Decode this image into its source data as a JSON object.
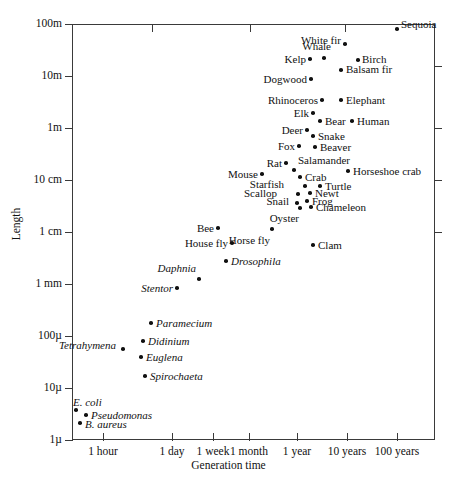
{
  "chart_data": {
    "type": "scatter",
    "title": "",
    "xlabel": "Generation time",
    "ylabel": "Length",
    "xscale": "log",
    "yscale": "log",
    "grid": false,
    "legend": null,
    "xtick_labels": [
      "1 hour",
      "1 day",
      "1 week",
      "1 month",
      "1 year",
      "10 years",
      "100 years"
    ],
    "ytick_labels": [
      "100m",
      "10m",
      "1m",
      "10 cm",
      "1 cm",
      "1 mm",
      "100µ",
      "10µ",
      "1µ"
    ],
    "points": [
      {
        "name": "Sequoia",
        "x": 397,
        "y": 29,
        "lx": 401,
        "ly": 24,
        "side": "l",
        "italic": false
      },
      {
        "name": "White fir",
        "x": 345,
        "y": 44,
        "lx": 341,
        "ly": 40,
        "side": "r",
        "italic": false
      },
      {
        "name": "Birch",
        "x": 358,
        "y": 60,
        "lx": 362,
        "ly": 59,
        "side": "l",
        "italic": false
      },
      {
        "name": "Whale",
        "x": 324,
        "y": 58,
        "lx": 331,
        "ly": 46,
        "side": "r",
        "italic": false
      },
      {
        "name": "Balsam fir",
        "x": 341,
        "y": 70,
        "lx": 346,
        "ly": 69,
        "side": "l",
        "italic": false
      },
      {
        "name": "Kelp",
        "x": 310,
        "y": 59,
        "lx": 306,
        "ly": 59,
        "side": "r",
        "italic": false
      },
      {
        "name": "Dogwood",
        "x": 311,
        "y": 79,
        "lx": 307,
        "ly": 79,
        "side": "r",
        "italic": false
      },
      {
        "name": "Rhinoceros",
        "x": 322,
        "y": 100,
        "lx": 318,
        "ly": 100,
        "side": "r",
        "italic": false
      },
      {
        "name": "Elephant",
        "x": 341,
        "y": 100,
        "lx": 346,
        "ly": 100,
        "side": "l",
        "italic": false
      },
      {
        "name": "Elk",
        "x": 313,
        "y": 113,
        "lx": 309,
        "ly": 113,
        "side": "r",
        "italic": false
      },
      {
        "name": "Bear",
        "x": 320,
        "y": 121,
        "lx": 325,
        "ly": 121,
        "side": "l",
        "italic": false
      },
      {
        "name": "Human",
        "x": 352,
        "y": 121,
        "lx": 357,
        "ly": 121,
        "side": "l",
        "italic": false
      },
      {
        "name": "Deer",
        "x": 307,
        "y": 130,
        "lx": 303,
        "ly": 130,
        "side": "r",
        "italic": false
      },
      {
        "name": "Snake",
        "x": 313,
        "y": 136,
        "lx": 318,
        "ly": 136,
        "side": "l",
        "italic": false
      },
      {
        "name": "Beaver",
        "x": 315,
        "y": 147,
        "lx": 320,
        "ly": 147,
        "side": "l",
        "italic": false
      },
      {
        "name": "Fox",
        "x": 299,
        "y": 146,
        "lx": 295,
        "ly": 146,
        "side": "r",
        "italic": false
      },
      {
        "name": "Rat",
        "x": 286,
        "y": 163,
        "lx": 282,
        "ly": 163,
        "side": "r",
        "italic": false
      },
      {
        "name": "Salamander",
        "x": 294,
        "y": 170,
        "lx": 298,
        "ly": 160,
        "side": "l",
        "italic": false
      },
      {
        "name": "Horseshoe crab",
        "x": 348,
        "y": 171,
        "lx": 353,
        "ly": 171,
        "side": "l",
        "italic": false
      },
      {
        "name": "Mouse",
        "x": 262,
        "y": 174,
        "lx": 258,
        "ly": 174,
        "side": "r",
        "italic": false
      },
      {
        "name": "Crab",
        "x": 300,
        "y": 177,
        "lx": 305,
        "ly": 177,
        "side": "l",
        "italic": false
      },
      {
        "name": "Starfish",
        "x": 305,
        "y": 186,
        "lx": 284,
        "ly": 184,
        "side": "r",
        "italic": false
      },
      {
        "name": "Turtle",
        "x": 320,
        "y": 186,
        "lx": 325,
        "ly": 186,
        "side": "l",
        "italic": false
      },
      {
        "name": "Newt",
        "x": 310,
        "y": 193,
        "lx": 315,
        "ly": 193,
        "side": "l",
        "italic": false
      },
      {
        "name": "Scallop",
        "x": 298,
        "y": 194,
        "lx": 277,
        "ly": 193,
        "side": "r",
        "italic": false
      },
      {
        "name": "Frog",
        "x": 307,
        "y": 201,
        "lx": 312,
        "ly": 201,
        "side": "l",
        "italic": false
      },
      {
        "name": "Chameleon",
        "x": 311,
        "y": 207,
        "lx": 316,
        "ly": 207,
        "side": "l",
        "italic": false
      },
      {
        "name": "Snail",
        "x": 297,
        "y": 203,
        "lx": 289,
        "ly": 201,
        "side": "r",
        "italic": false
      },
      {
        "name": "Oyster",
        "x": 300,
        "y": 208,
        "lx": 299,
        "ly": 218,
        "side": "r",
        "italic": false
      },
      {
        "name": "Horse fly",
        "x": 272,
        "y": 229,
        "lx": 270,
        "ly": 240,
        "side": "r",
        "italic": false
      },
      {
        "name": "Bee",
        "x": 218,
        "y": 228,
        "lx": 214,
        "ly": 228,
        "side": "r",
        "italic": false
      },
      {
        "name": "Clam",
        "x": 313,
        "y": 245,
        "lx": 318,
        "ly": 245,
        "side": "l",
        "italic": false
      },
      {
        "name": "House fly",
        "x": 232,
        "y": 243,
        "lx": 228,
        "ly": 243,
        "side": "r",
        "italic": false
      },
      {
        "name": "Drosophila",
        "x": 226,
        "y": 261,
        "lx": 231,
        "ly": 261,
        "side": "l",
        "italic": true
      },
      {
        "name": "Daphnia",
        "x": 199,
        "y": 279,
        "lx": 196,
        "ly": 268,
        "side": "r",
        "italic": true
      },
      {
        "name": "Stentor",
        "x": 177,
        "y": 288,
        "lx": 173,
        "ly": 288,
        "side": "r",
        "italic": true
      },
      {
        "name": "Paramecium",
        "x": 151,
        "y": 323,
        "lx": 156,
        "ly": 323,
        "side": "l",
        "italic": true
      },
      {
        "name": "Didinium",
        "x": 143,
        "y": 341,
        "lx": 148,
        "ly": 341,
        "side": "l",
        "italic": true
      },
      {
        "name": "Tetrahymena",
        "x": 123,
        "y": 349,
        "lx": 116,
        "ly": 345,
        "side": "r",
        "italic": true
      },
      {
        "name": "Euglena",
        "x": 141,
        "y": 357,
        "lx": 146,
        "ly": 357,
        "side": "l",
        "italic": true
      },
      {
        "name": "Spirochaeta",
        "x": 145,
        "y": 376,
        "lx": 150,
        "ly": 376,
        "side": "l",
        "italic": true
      },
      {
        "name": "E. coli",
        "x": 76,
        "y": 410,
        "lx": 73,
        "ly": 402,
        "side": "l",
        "italic": true
      },
      {
        "name": "Pseudomonas",
        "x": 86,
        "y": 415,
        "lx": 91,
        "ly": 415,
        "side": "l",
        "italic": true
      },
      {
        "name": "B. aureus",
        "x": 80,
        "y": 423,
        "lx": 85,
        "ly": 424,
        "side": "l",
        "italic": true
      }
    ]
  },
  "axes": {
    "ylabel": "Length",
    "xlabel": "Generation time",
    "yticks": [
      {
        "label": "100m",
        "y": 24
      },
      {
        "label": "10m",
        "y": 76
      },
      {
        "label": "1m",
        "y": 128
      },
      {
        "label": "10 cm",
        "y": 180
      },
      {
        "label": "1 cm",
        "y": 232
      },
      {
        "label": "1 mm",
        "y": 284
      },
      {
        "label": "100µ",
        "y": 336
      },
      {
        "label": "10µ",
        "y": 388
      },
      {
        "label": "1µ",
        "y": 440
      }
    ],
    "yticks_right": [
      66,
      128,
      180,
      232
    ],
    "xticks": [
      {
        "label": "1 hour",
        "x": 103
      },
      {
        "label": "1 day",
        "x": 172
      },
      {
        "label": "1 week",
        "x": 213
      },
      {
        "label": "1 month",
        "x": 249
      },
      {
        "label": "1 year",
        "x": 297
      },
      {
        "label": "10 years",
        "x": 347
      },
      {
        "label": "100 years",
        "x": 397
      }
    ],
    "xticks_top": [
      152,
      250,
      345
    ]
  }
}
